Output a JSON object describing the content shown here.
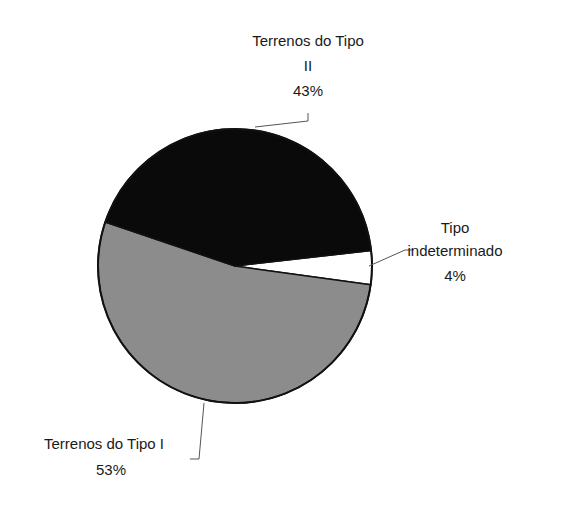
{
  "chart_data": {
    "type": "pie",
    "title": "",
    "slices": [
      {
        "label": "Tipo indeterminado",
        "label_lines": [
          "Tipo",
          "indeterminado"
        ],
        "value": 4,
        "value_label": "4%",
        "color": "#ffffff"
      },
      {
        "label": "Terrenos do Tipo I",
        "label_lines": [
          "Terrenos do Tipo I"
        ],
        "value": 53,
        "value_label": "53%",
        "color": "#8c8c8c"
      },
      {
        "label": "Terrenos do Tipo II",
        "label_lines": [
          "Terrenos do Tipo",
          "II"
        ],
        "value": 43,
        "value_label": "43%",
        "color": "#0a0a0a"
      }
    ],
    "legend": "none",
    "data_labels": "outside-with-leader-lines"
  }
}
